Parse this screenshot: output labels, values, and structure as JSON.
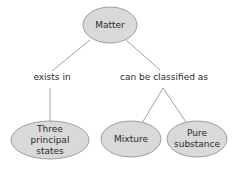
{
  "diagram": {
    "type": "concept-map",
    "colors": {
      "node_fill": "#d9d9d9",
      "node_stroke": "#8a8a8a",
      "edge": "#8a8a8a",
      "text": "#2a2a2a"
    },
    "nodes": {
      "root": {
        "label": "Matter"
      },
      "states": {
        "label": "Three principal states"
      },
      "mixture": {
        "label": "Mixture"
      },
      "pure": {
        "label": "Pure substance"
      }
    },
    "links": {
      "exists_in": "exists in",
      "classified_as": "can be classified as"
    }
  }
}
